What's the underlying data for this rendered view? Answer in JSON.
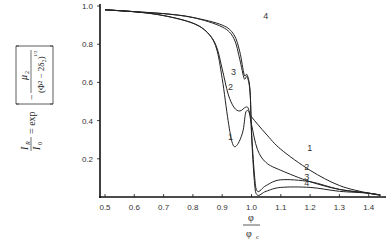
{
  "chart_data": {
    "type": "line",
    "title": "",
    "xlabel": "φ / φ_c",
    "ylabel": "I_R / I_0 = exp[ − μ_2 / (Φ² − 2δ_2)^(1/2) ]",
    "xlim": [
      0.47,
      1.45
    ],
    "ylim": [
      0,
      1.0
    ],
    "xticks": [
      "0.5",
      "0.6",
      "0.7",
      "0.8",
      "0.9",
      "1.0",
      "1.1",
      "1.2",
      "1.3",
      "1.4"
    ],
    "yticks": [
      "0.2",
      "0.4",
      "0.6",
      "0.8",
      "1.0"
    ],
    "grid": false,
    "legend": "inline curve labels 1–4",
    "series": [
      {
        "name": "1",
        "x": [
          0.5,
          0.6,
          0.7,
          0.8,
          0.85,
          0.88,
          0.9,
          0.92,
          0.935,
          0.95,
          0.97,
          0.98,
          0.99,
          1.0,
          1.05,
          1.1,
          1.2,
          1.3,
          1.4,
          1.44
        ],
        "y": [
          0.98,
          0.97,
          0.95,
          0.91,
          0.86,
          0.78,
          0.62,
          0.4,
          0.28,
          0.27,
          0.34,
          0.44,
          0.45,
          0.42,
          0.33,
          0.25,
          0.14,
          0.06,
          0.02,
          0.01
        ]
      },
      {
        "name": "2",
        "x": [
          0.5,
          0.6,
          0.7,
          0.8,
          0.85,
          0.88,
          0.9,
          0.92,
          0.94,
          0.96,
          0.98,
          0.99,
          1.0,
          1.02,
          1.05,
          1.1,
          1.2,
          1.3,
          1.4,
          1.44
        ],
        "y": [
          0.98,
          0.97,
          0.95,
          0.91,
          0.86,
          0.79,
          0.67,
          0.54,
          0.47,
          0.45,
          0.47,
          0.46,
          0.38,
          0.25,
          0.18,
          0.14,
          0.08,
          0.04,
          0.02,
          0.01
        ]
      },
      {
        "name": "3",
        "x": [
          0.5,
          0.6,
          0.7,
          0.8,
          0.9,
          0.94,
          0.96,
          0.975,
          0.985,
          0.995,
          1.0,
          1.01,
          1.02,
          1.05,
          1.1,
          1.2,
          1.3,
          1.4,
          1.44
        ],
        "y": [
          0.98,
          0.97,
          0.96,
          0.94,
          0.89,
          0.83,
          0.72,
          0.62,
          0.63,
          0.55,
          0.35,
          0.12,
          0.03,
          0.06,
          0.09,
          0.08,
          0.04,
          0.02,
          0.01
        ]
      },
      {
        "name": "4",
        "x": [
          0.5,
          0.6,
          0.7,
          0.8,
          0.9,
          0.94,
          0.96,
          0.975,
          0.985,
          0.995,
          1.0,
          1.01,
          1.02,
          1.05,
          1.1,
          1.2,
          1.3,
          1.4,
          1.44
        ],
        "y": [
          0.98,
          0.97,
          0.96,
          0.94,
          0.9,
          0.85,
          0.76,
          0.64,
          0.64,
          0.56,
          0.33,
          0.08,
          0.01,
          0.03,
          0.05,
          0.05,
          0.03,
          0.02,
          0.01
        ]
      }
    ],
    "curve_labels": [
      {
        "text": "1",
        "x": 0.92,
        "y": 0.3
      },
      {
        "text": "2",
        "x": 0.92,
        "y": 0.56
      },
      {
        "text": "3",
        "x": 0.93,
        "y": 0.64
      },
      {
        "text": "4",
        "x": 1.04,
        "y": 0.93
      },
      {
        "text": "1",
        "x": 1.19,
        "y": 0.24
      },
      {
        "text": "2",
        "x": 1.18,
        "y": 0.14
      },
      {
        "text": "3",
        "x": 1.18,
        "y": 0.09
      },
      {
        "text": "4",
        "x": 1.18,
        "y": 0.06
      }
    ]
  },
  "axes": {
    "x_numer": "φ",
    "x_denom": "φ",
    "x_denom_sub": "c",
    "y_lhs_num": "I",
    "y_lhs_num_sub": "R",
    "y_lhs_den": "I",
    "y_lhs_den_sub": "0",
    "y_eq": "= exp",
    "y_mu": "μ",
    "y_mu_sub": "2",
    "y_den": "(Φ² − 2δ₂)",
    "y_den_exp": "1/2"
  }
}
